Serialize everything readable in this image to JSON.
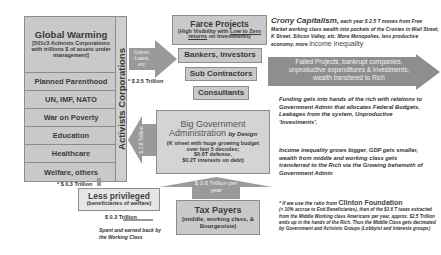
{
  "left_stack": {
    "global_warming": {
      "title": "Global Warming",
      "subtitle": "[501c3 Activists Corporations with trillions $ of assets under management]"
    },
    "items": [
      "Planned Parenthood",
      "UN, IMF, NATO",
      "War on Poverty",
      "Education",
      "Healthcare",
      "Welfare, others"
    ],
    "vertical_label": "Activists Corporations"
  },
  "arrows": {
    "grants": "Grants, Loans, etc.",
    "grants_amount": "* $ 2.5 Trillion",
    "activists_inflow": "$ 2.8 Trillion",
    "tax_inflow": "$ 3.6 Trillion per year",
    "less_privileged_amount": "* $ 0.3 Trillion",
    "working_class_amount": "$ 0.3 Trillion",
    "failed_projects": "Failed Projects, bankrupt companies, unproductive expenditures & investments, wealth transfered to Rich"
  },
  "farce": {
    "title": "Farce Projects",
    "subtitle_pre": "(High Visibility with ",
    "subtitle_underline": "Low to Zero returns",
    "subtitle_post": " on Investments)"
  },
  "recipients": [
    "Bankers, Investors",
    "Sub Contractors",
    "Consultants"
  ],
  "big_gov": {
    "title1": "Big Government",
    "title2": "Administration",
    "title2_suffix": "by Design",
    "details": [
      "(K street with huge growing budget",
      "over last 5 decodes;",
      "$0.6T defense,",
      "$0.2T interests on debt)"
    ]
  },
  "less_privileged": {
    "title": "Less privileged",
    "subtitle": "(beneficiaries of welfare)"
  },
  "working_class_note": "Spent and earned back by the Working Class",
  "tax_payers": {
    "title": "Tax Payers",
    "subtitle": "(middle, working class, & Bourgeoisie)"
  },
  "notes": {
    "crony_title": "Crony Capitalism,",
    "crony_body": " each year $ 2.5 T moves from Free Market working class wealth into pockets of the Cronies in Wall Street, K Street, Silicon Valley, etc. More Monopolies, less productive economy, more ",
    "crony_emph": "income inequality",
    "funding": "Funding gets into hands of the rich with relations to Government Admin that allocates Federal Budgets, Leakages from the system, Unproductive 'Investments',",
    "inequality": "Income inequality grows bigger, GDP gets smaller, wealth from middle and working class gets transferred to the Rich via the Growing behemoth of Government Admin",
    "clinton_pre": "* If we use the ratio from ",
    "clinton_name": "Clinton Foundation",
    "clinton_body": "(< 10% accrue to End Beneficiaries), then of the $3.6 T taxes extracted from the Middle Working class Americans per year, approx. $2.5 Trillion ends up in the hands of the Rich. Thus the Middle Class gets decimated by Government and Activists Groups (Lobbyist and Interests groups)"
  },
  "colors": {
    "box_fill": "#c9c9c9",
    "box_border": "#8c8c8c",
    "arrow_fill": "#9a9a9a",
    "text": "#3a3a3a"
  }
}
